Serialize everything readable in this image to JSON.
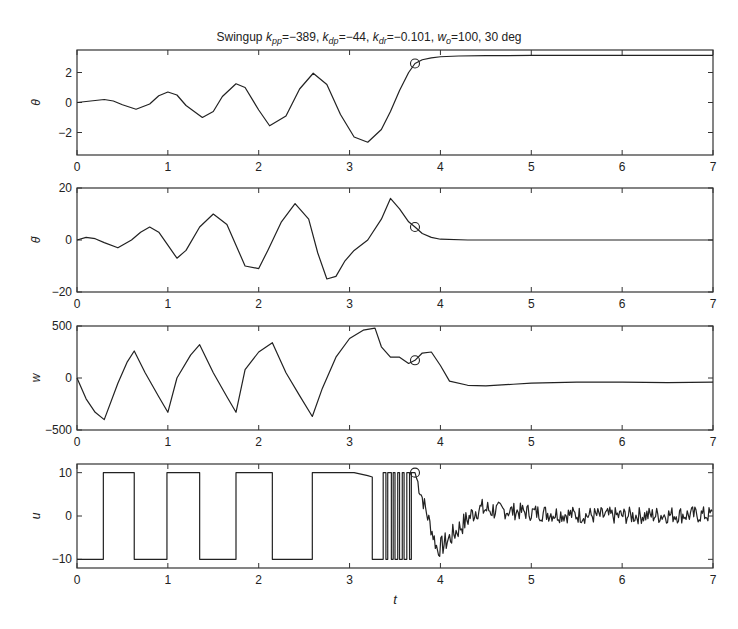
{
  "title": {
    "prefix": "Swingup ",
    "parts": [
      {
        "sym": "k",
        "sub": "pp",
        "val": "=−389, "
      },
      {
        "sym": "k",
        "sub": "dp",
        "val": "=−44, "
      },
      {
        "sym": "k",
        "sub": "dr",
        "val": "=−0.101, "
      },
      {
        "sym": "w",
        "sub": "o",
        "val": "=100, 30 deg"
      }
    ],
    "full_text": "Swingup k_pp=-389, k_dp=-44, k_dr=-0.101, w_o=100, 30 deg"
  },
  "colors": {
    "line": "#222222",
    "axis": "#333333",
    "background": "#ffffff"
  },
  "chart_data": [
    {
      "type": "line",
      "title": "Swingup k_pp=-389, k_dp=-44, k_dr=-0.101, w_o=100, 30 deg",
      "ylabel": "θ",
      "xlabel": "",
      "xlim": [
        0,
        7
      ],
      "ylim": [
        -3.5,
        3.5
      ],
      "xticks": [
        0,
        1,
        2,
        3,
        4,
        5,
        6,
        7
      ],
      "yticks": [
        -2,
        0,
        2
      ],
      "ytick_labels": [
        "−2",
        "0",
        "2"
      ],
      "grid": false,
      "marker": {
        "x": 3.72,
        "y": 2.6,
        "shape": "circle"
      },
      "x": [
        0,
        0.15,
        0.3,
        0.4,
        0.5,
        0.65,
        0.8,
        0.9,
        1.0,
        1.1,
        1.2,
        1.38,
        1.5,
        1.6,
        1.75,
        1.85,
        2.0,
        2.12,
        2.3,
        2.45,
        2.6,
        2.75,
        2.9,
        3.05,
        3.2,
        3.35,
        3.45,
        3.55,
        3.65,
        3.72,
        3.8,
        3.9,
        4.0,
        4.2,
        4.5,
        5.0,
        6.0,
        7.0
      ],
      "y": [
        0,
        0.1,
        0.2,
        0.1,
        -0.15,
        -0.45,
        -0.1,
        0.45,
        0.7,
        0.5,
        -0.2,
        -1.0,
        -0.6,
        0.4,
        1.25,
        1.0,
        -0.5,
        -1.55,
        -0.9,
        0.9,
        1.95,
        1.2,
        -0.8,
        -2.3,
        -2.65,
        -1.8,
        -0.6,
        0.8,
        2.0,
        2.6,
        2.85,
        2.98,
        3.05,
        3.1,
        3.12,
        3.14,
        3.14,
        3.14
      ]
    },
    {
      "type": "line",
      "ylabel": "θ̇",
      "xlabel": "",
      "xlim": [
        0,
        7
      ],
      "ylim": [
        -20,
        20
      ],
      "xticks": [
        0,
        1,
        2,
        3,
        4,
        5,
        6,
        7
      ],
      "yticks": [
        -20,
        0,
        20
      ],
      "ytick_labels": [
        "−20",
        "0",
        "20"
      ],
      "grid": false,
      "marker": {
        "x": 3.72,
        "y": 5,
        "shape": "circle"
      },
      "x": [
        0,
        0.1,
        0.2,
        0.3,
        0.45,
        0.6,
        0.7,
        0.8,
        0.9,
        1.0,
        1.1,
        1.2,
        1.35,
        1.5,
        1.65,
        1.75,
        1.85,
        2.0,
        2.1,
        2.25,
        2.4,
        2.55,
        2.65,
        2.75,
        2.85,
        2.95,
        3.05,
        3.2,
        3.35,
        3.45,
        3.55,
        3.65,
        3.72,
        3.8,
        3.9,
        4.0,
        4.3,
        5.0,
        6.0,
        7.0
      ],
      "y": [
        0,
        1,
        0.5,
        -1,
        -3,
        0,
        3,
        5,
        3,
        -2,
        -7,
        -4,
        5,
        10,
        6,
        -2,
        -10,
        -11,
        -4,
        7,
        14,
        8,
        -5,
        -15,
        -14,
        -8,
        -4,
        0,
        8,
        16,
        12,
        7,
        5,
        2.5,
        1,
        0.3,
        0,
        0,
        0,
        0
      ]
    },
    {
      "type": "line",
      "ylabel": "w",
      "xlabel": "",
      "xlim": [
        0,
        7
      ],
      "ylim": [
        -500,
        500
      ],
      "xticks": [
        0,
        1,
        2,
        3,
        4,
        5,
        6,
        7
      ],
      "yticks": [
        -500,
        0,
        500
      ],
      "ytick_labels": [
        "−500",
        "0",
        "500"
      ],
      "grid": false,
      "marker": {
        "x": 3.72,
        "y": 170,
        "shape": "circle"
      },
      "x": [
        0,
        0.1,
        0.2,
        0.3,
        0.45,
        0.55,
        0.63,
        0.75,
        0.9,
        1.0,
        1.1,
        1.25,
        1.35,
        1.5,
        1.65,
        1.75,
        1.85,
        2.0,
        2.15,
        2.3,
        2.45,
        2.59,
        2.7,
        2.85,
        3.0,
        3.15,
        3.28,
        3.35,
        3.45,
        3.55,
        3.65,
        3.72,
        3.8,
        3.9,
        4.0,
        4.1,
        4.3,
        4.5,
        4.8,
        5.0,
        5.5,
        6.0,
        6.5,
        7.0
      ],
      "y": [
        0,
        -200,
        -330,
        -400,
        -50,
        150,
        260,
        50,
        -180,
        -330,
        0,
        220,
        320,
        50,
        -180,
        -330,
        80,
        250,
        340,
        50,
        -170,
        -370,
        -100,
        200,
        380,
        460,
        480,
        300,
        200,
        200,
        140,
        170,
        240,
        250,
        120,
        -30,
        -70,
        -75,
        -60,
        -50,
        -40,
        -40,
        -45,
        -40
      ]
    },
    {
      "type": "line",
      "ylabel": "u",
      "xlabel": "t",
      "xlim": [
        0,
        7
      ],
      "ylim": [
        -12,
        12
      ],
      "xticks": [
        0,
        1,
        2,
        3,
        4,
        5,
        6,
        7
      ],
      "yticks": [
        -10,
        0,
        10
      ],
      "ytick_labels": [
        "−10",
        "0",
        "10"
      ],
      "grid": false,
      "marker": {
        "x": 3.72,
        "y": 10,
        "shape": "circle"
      },
      "description": "Bang-bang control switching between -10 and +10 until ~3.25s, rapid chattering 3.35–3.7s, then damped noisy response settling near 0",
      "switch_times": [
        0.29,
        0.63,
        0.99,
        1.35,
        1.75,
        2.15,
        2.59,
        3.25
      ],
      "x": [
        0,
        0.29,
        0.29,
        0.63,
        0.63,
        0.99,
        0.99,
        1.35,
        1.35,
        1.75,
        1.75,
        2.15,
        2.15,
        2.59,
        2.59,
        3.05,
        3.2,
        3.25,
        3.25,
        3.35
      ],
      "y": [
        -10,
        -10,
        10,
        10,
        -10,
        -10,
        10,
        10,
        -10,
        -10,
        10,
        10,
        -10,
        -10,
        10,
        10,
        9.3,
        9,
        -10,
        -10
      ]
    }
  ],
  "axes": {
    "xtick_labels": [
      "0",
      "1",
      "2",
      "3",
      "4",
      "5",
      "6",
      "7"
    ]
  }
}
